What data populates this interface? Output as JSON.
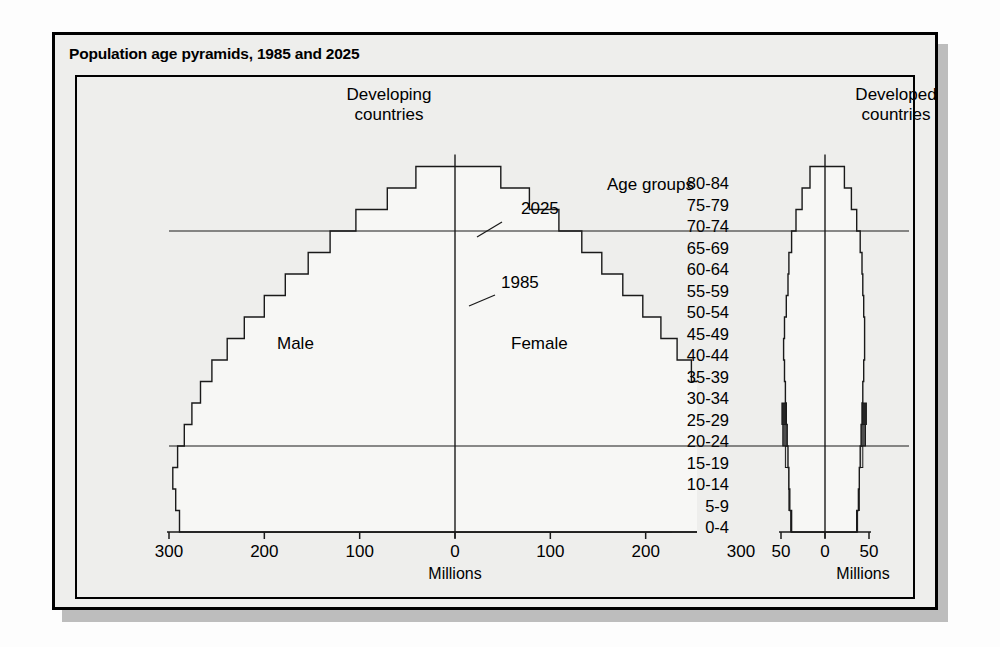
{
  "title": "Population age pyramids, 1985 and 2025",
  "panels": {
    "left": {
      "heading_line1": "Developing",
      "heading_line2": "countries",
      "axis_title": "Millions"
    },
    "right": {
      "heading_line1": "Developed",
      "heading_line2": "countries",
      "axis_title": "Millions"
    }
  },
  "labels": {
    "age_groups": "Age groups",
    "male": "Male",
    "female": "Female",
    "year_2025": "2025",
    "year_1985": "1985"
  },
  "age_groups": [
    "80-84",
    "75-79",
    "70-74",
    "65-69",
    "60-64",
    "55-59",
    "50-54",
    "45-49",
    "40-44",
    "35-39",
    "30-34",
    "25-29",
    "20-24",
    "15-19",
    "10-14",
    "5-9",
    "0-4"
  ],
  "left_ticks": [
    "300",
    "200",
    "100",
    "0",
    "100",
    "200",
    "300"
  ],
  "right_ticks": [
    "50",
    "0",
    "50"
  ],
  "colors": {
    "shade_light": "#d9d9d7",
    "shade_medium": "#9c9c9a",
    "shade_dark": "#4e4e4e",
    "shade_darkest": "#262626",
    "outline": "#1a1a1a",
    "background": "#eeeeec",
    "frame": "#000000"
  },
  "chart_data": {
    "type": "bar",
    "title": "Population age pyramids, 1985 and 2025",
    "subtitle": "Developing countries and Developed countries",
    "xlabel": "Millions",
    "ylabel": "Age groups",
    "orientation": "horizontal-pyramid",
    "grid": false,
    "legend": [
      "1985 (filled bars)",
      "2025 (outline)"
    ],
    "categories": [
      "0-4",
      "5-9",
      "10-14",
      "15-19",
      "20-24",
      "25-29",
      "30-34",
      "35-39",
      "40-44",
      "45-49",
      "50-54",
      "55-59",
      "60-64",
      "65-69",
      "70-74",
      "75-79",
      "80-84"
    ],
    "panels": [
      {
        "name": "Developing countries",
        "xlim": [
          -300,
          300
        ],
        "xticks": [
          -300,
          -200,
          -100,
          0,
          100,
          200,
          300
        ],
        "units": "millions",
        "series": [
          {
            "name": "1985 Male",
            "side": "left",
            "values": [
              235,
              209,
              196,
              172,
              150,
              130,
              110,
              94,
              80,
              67,
              55,
              45,
              34,
              24,
              16,
              9,
              4
            ]
          },
          {
            "name": "1985 Female",
            "side": "right",
            "values": [
              227,
              202,
              190,
              166,
              145,
              126,
              107,
              91,
              77,
              65,
              53,
              43,
              33,
              23,
              16,
              9,
              5
            ]
          },
          {
            "name": "2025 Male",
            "side": "left",
            "values": [
              289,
              293,
              296,
              291,
              284,
              276,
              267,
              255,
              239,
              221,
              200,
              178,
              154,
              131,
              104,
              71,
              41
            ]
          },
          {
            "name": "2025 Female",
            "side": "right",
            "values": [
              277,
              281,
              284,
              280,
              274,
              267,
              259,
              248,
              233,
              216,
              197,
              176,
              154,
              133,
              109,
              78,
              48
            ]
          }
        ]
      },
      {
        "name": "Developed countries",
        "xlim": [
          -50,
          50
        ],
        "xticks": [
          -50,
          0,
          50
        ],
        "units": "millions",
        "series": [
          {
            "name": "1985 Male",
            "side": "left",
            "values": [
              39,
              41,
              41,
              45,
              48,
              49,
              42,
              36,
              37,
              32,
              30,
              27,
              25,
              19,
              14,
              9,
              4
            ]
          },
          {
            "name": "1985 Female",
            "side": "right",
            "values": [
              37,
              39,
              39,
              43,
              46,
              47,
              41,
              35,
              36,
              32,
              30,
              28,
              27,
              22,
              18,
              13,
              7
            ]
          },
          {
            "name": "2025 Male",
            "side": "left",
            "values": [
              38,
              40,
              41,
              42,
              43,
              44,
              45,
              46,
              47,
              46,
              44,
              42,
              41,
              38,
              33,
              26,
              17
            ]
          },
          {
            "name": "2025 Female",
            "side": "right",
            "values": [
              36,
              38,
              39,
              40,
              41,
              42,
              43,
              44,
              45,
              45,
              44,
              43,
              42,
              40,
              36,
              30,
              22
            ]
          }
        ]
      }
    ]
  }
}
